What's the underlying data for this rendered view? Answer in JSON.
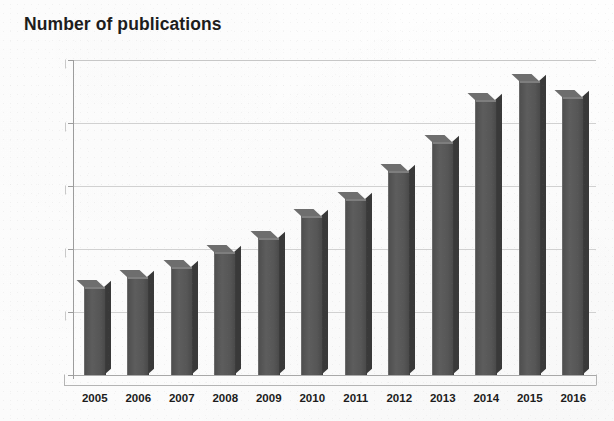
{
  "chart_data": {
    "type": "bar",
    "title": "Number of publications",
    "xlabel": "",
    "ylabel": "",
    "categories": [
      "2005",
      "2006",
      "2007",
      "2008",
      "2009",
      "2010",
      "2011",
      "2012",
      "2013",
      "2014",
      "2015",
      "2016"
    ],
    "values": [
      700,
      780,
      860,
      980,
      1090,
      1260,
      1400,
      1620,
      1850,
      2180,
      2330,
      2210
    ],
    "ylim": [
      0,
      2500
    ],
    "yticks": [
      0,
      500,
      1000,
      1500,
      2000,
      2500
    ],
    "ytick_labels": [
      "0",
      "500",
      "1000",
      "1500",
      "2000",
      "2500"
    ],
    "grid": true,
    "legend": false,
    "style": "3d-columns",
    "bar_color": "#565656",
    "grid_color": "#c9c9c9",
    "axis_color": "#9d9d9d",
    "text_color": "#1c1c1c",
    "background_color": "#ffffff"
  }
}
